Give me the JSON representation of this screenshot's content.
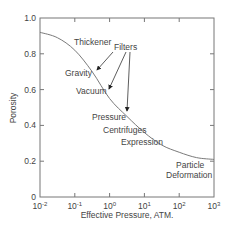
{
  "chart_data": {
    "type": "line",
    "title": "",
    "xlabel": "Effective Pressure, ATM.",
    "ylabel": "Porosity",
    "xscale": "log",
    "xlim": [
      0.01,
      1000
    ],
    "ylim": [
      0,
      1.0
    ],
    "grid": false,
    "legend": null,
    "x_ticks": [
      {
        "base": "10",
        "exp": "-2",
        "value": 0.01
      },
      {
        "base": "10",
        "exp": "-1",
        "value": 0.1
      },
      {
        "base": "10",
        "exp": "0",
        "value": 1
      },
      {
        "base": "10",
        "exp": "1",
        "value": 10
      },
      {
        "base": "10",
        "exp": "2",
        "value": 100
      },
      {
        "base": "10",
        "exp": "3",
        "value": 1000
      }
    ],
    "y_ticks": [
      "0",
      "0.2",
      "0.4",
      "0.6",
      "0.8",
      "1.0"
    ],
    "series": [
      {
        "name": "Porosity vs Effective Pressure",
        "x": [
          0.01,
          0.0316,
          0.1,
          0.316,
          1,
          3.16,
          10,
          31.6,
          100,
          316,
          1000
        ],
        "values": [
          0.92,
          0.89,
          0.82,
          0.7,
          0.55,
          0.45,
          0.36,
          0.29,
          0.25,
          0.22,
          0.21
        ]
      }
    ],
    "annotations": [
      {
        "text": "Thickener",
        "x_px": 74,
        "y_px": 45
      },
      {
        "text": "Filters",
        "x_px": 114,
        "y_px": 50
      },
      {
        "text": "Gravity",
        "x_px": 65,
        "y_px": 76
      },
      {
        "text": "Vacuum",
        "x_px": 76,
        "y_px": 94
      },
      {
        "text": "Pressure",
        "x_px": 92,
        "y_px": 120
      },
      {
        "text": "Centrifuges",
        "x_px": 103,
        "y_px": 133
      },
      {
        "text": "Expression",
        "x_px": 121,
        "y_px": 145
      },
      {
        "text": "Particle",
        "x_px": 176,
        "y_px": 168
      },
      {
        "text": "Deformation",
        "x_px": 166,
        "y_px": 178
      }
    ],
    "arrows": [
      {
        "from": "Filters",
        "to": "Gravity",
        "x1": 113,
        "y1": 52,
        "x2": 97,
        "y2": 70
      },
      {
        "from": "Filters",
        "to": "Vacuum",
        "x1": 126,
        "y1": 52,
        "x2": 109,
        "y2": 89
      },
      {
        "from": "Filters",
        "to": "Pressure",
        "x1": 130,
        "y1": 52,
        "x2": 127,
        "y2": 111
      }
    ]
  },
  "colors": {
    "axis": "#777777",
    "curve": "#7a7a7a",
    "text": "#444444",
    "arrow": "#333333"
  }
}
